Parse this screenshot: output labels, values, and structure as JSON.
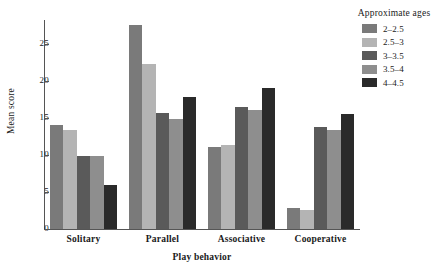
{
  "chart_data": {
    "type": "bar",
    "title": "",
    "xlabel": "Play behavior",
    "ylabel": "Mean score",
    "categories": [
      "Solitary",
      "Parallel",
      "Associative",
      "Cooperative"
    ],
    "series": [
      {
        "name": "2–2.5",
        "color": "#7a7a7a",
        "values": [
          14.1,
          27.5,
          11.1,
          2.8
        ]
      },
      {
        "name": "2.5–3",
        "color": "#b4b4b4",
        "values": [
          13.4,
          22.3,
          11.3,
          2.6
        ]
      },
      {
        "name": "3–3.5",
        "color": "#5a5a5a",
        "values": [
          9.8,
          15.7,
          16.5,
          13.7
        ]
      },
      {
        "name": "3.5–4",
        "color": "#8e8e8e",
        "values": [
          9.8,
          14.9,
          16.0,
          13.3
        ]
      },
      {
        "name": "4–4.5",
        "color": "#2a2a2a",
        "values": [
          6.0,
          17.8,
          19.0,
          15.5
        ]
      }
    ],
    "ylim": [
      0,
      28.2
    ],
    "yticks": [
      0,
      5,
      10,
      15,
      20,
      25
    ],
    "ytick_labels": [
      "0",
      "5",
      "10",
      "15",
      "20",
      "25"
    ],
    "grid": false,
    "legend_position": "top-right",
    "legend_title": "Approximate ages"
  }
}
